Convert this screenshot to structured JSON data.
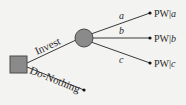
{
  "diagram": {
    "type": "decision-tree",
    "colors": {
      "background": "#f3f3f1",
      "line": "#3a3a3a",
      "node_fill": "#8a8a8a",
      "node_stroke": "#4a4a4a"
    },
    "decision_node": {
      "shape": "square"
    },
    "chance_node": {
      "shape": "circle"
    },
    "branches": {
      "invest": {
        "label": "Invest"
      },
      "do_nothing": {
        "label": "Do-Nothing"
      }
    },
    "outcomes": [
      {
        "branch_label": "a",
        "result_prefix": "PW|",
        "result_var": "a"
      },
      {
        "branch_label": "b",
        "result_prefix": "PW|",
        "result_var": "b"
      },
      {
        "branch_label": "c",
        "result_prefix": "PW|",
        "result_var": "c"
      }
    ]
  }
}
